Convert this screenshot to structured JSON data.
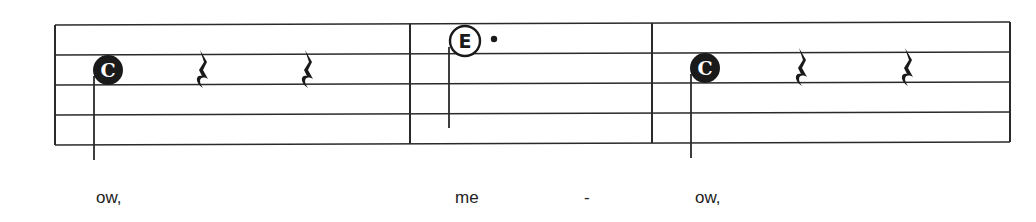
{
  "score": {
    "staff": {
      "line_count": 5,
      "left_x": 55,
      "right_x": 1010,
      "line_y_left": [
        25,
        55,
        85,
        115,
        145
      ],
      "line_y_right": [
        22,
        52,
        82,
        112,
        142
      ],
      "line_color": "#2a2a2a"
    },
    "barlines_x": [
      55,
      410,
      652,
      1010
    ],
    "measures": [
      {
        "index": 1,
        "events": [
          {
            "type": "note",
            "letter": "C",
            "style": "filled",
            "duration": "quarter"
          },
          {
            "type": "rest",
            "duration": "quarter"
          },
          {
            "type": "rest",
            "duration": "quarter"
          }
        ],
        "lyric": "ow,"
      },
      {
        "index": 2,
        "events": [
          {
            "type": "note",
            "letter": "E",
            "style": "hollow",
            "duration": "dotted half"
          }
        ],
        "lyrics": [
          "me",
          "-"
        ]
      },
      {
        "index": 3,
        "events": [
          {
            "type": "note",
            "letter": "C",
            "style": "filled",
            "duration": "quarter"
          },
          {
            "type": "rest",
            "duration": "quarter"
          },
          {
            "type": "rest",
            "duration": "quarter"
          }
        ],
        "lyric": "ow,"
      }
    ],
    "notes": {
      "m1_c": {
        "letter": "C",
        "cx": 108,
        "cy": 70
      },
      "m2_e": {
        "letter": "E",
        "cx": 465,
        "cy": 41,
        "dot": "•"
      },
      "m3_c": {
        "letter": "C",
        "cx": 705,
        "cy": 68
      }
    },
    "colors": {
      "ink": "#1a1a1a",
      "paper": "#ffffff",
      "note_letter_on_filled": "#ffffff"
    }
  },
  "lyrics": {
    "m1": "ow,",
    "m2a": "me",
    "m2b": "-",
    "m3": "ow,"
  }
}
